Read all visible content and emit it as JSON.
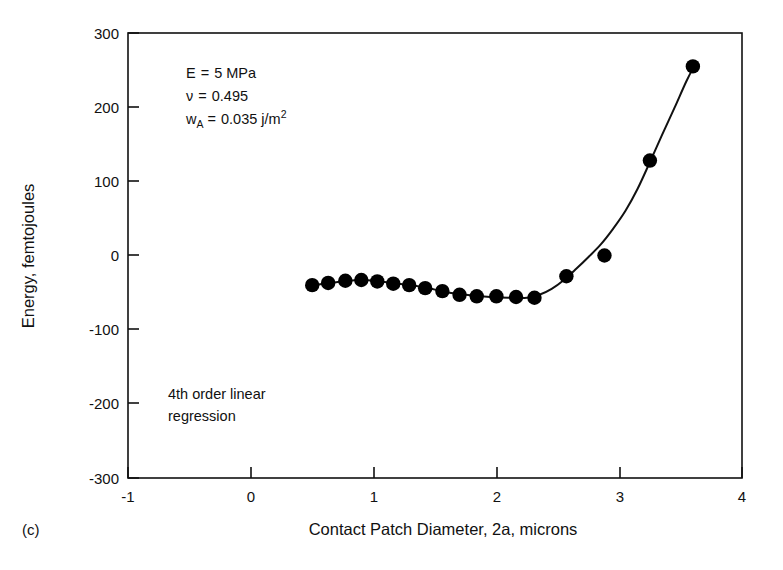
{
  "panel": {
    "label": "(c)"
  },
  "chart_data": {
    "type": "scatter",
    "title": "",
    "xlabel": "Contact Patch Diameter, 2a, microns",
    "ylabel": "Energy, femtojoules",
    "xlim": [
      -1,
      4
    ],
    "ylim": [
      -300,
      300
    ],
    "xticks": [
      -1,
      0,
      1,
      2,
      3,
      4
    ],
    "xtick_labels": [
      "-1",
      "0",
      "1",
      "2",
      "3",
      "4"
    ],
    "yticks": [
      -300,
      -200,
      -100,
      0,
      100,
      200,
      300
    ],
    "ytick_labels": [
      "-300",
      "-200",
      "-100",
      "0",
      "100",
      "200",
      "300"
    ],
    "grid": false,
    "legend": false,
    "marker": "filled-circle",
    "marker_color": "#000000",
    "line_color": "#000000",
    "series": [
      {
        "name": "Energy vs contact patch diameter",
        "x": [
          0.5,
          0.63,
          0.77,
          0.9,
          1.03,
          1.16,
          1.29,
          1.42,
          1.56,
          1.7,
          1.84,
          2.0,
          2.16,
          2.31,
          2.57,
          2.88,
          3.25,
          3.6
        ],
        "y": [
          -40,
          -37,
          -34,
          -33,
          -35,
          -38,
          -40,
          -44,
          -48,
          -53,
          -55,
          -55,
          -56,
          -57,
          -28,
          0,
          128,
          255
        ]
      }
    ],
    "fit_curve": {
      "label": "4th order linear regression",
      "x": [
        0.45,
        0.6,
        0.75,
        0.9,
        1.05,
        1.2,
        1.35,
        1.5,
        1.65,
        1.8,
        1.95,
        2.1,
        2.25,
        2.35,
        2.45,
        2.55,
        2.65,
        2.75,
        2.85,
        2.95,
        3.05,
        3.15,
        3.25,
        3.35,
        3.45,
        3.55,
        3.62
      ],
      "y": [
        -41,
        -38,
        -35,
        -33,
        -35,
        -38,
        -41,
        -46,
        -51,
        -54,
        -56,
        -57,
        -57,
        -53,
        -45,
        -33,
        -18,
        -2,
        15,
        36,
        60,
        90,
        126,
        163,
        199,
        236,
        258
      ]
    },
    "annotations": [
      {
        "name": "parameters",
        "lines": [
          {
            "label": "E",
            "eq": "=",
            "value": "5 MPa"
          },
          {
            "label": "ν",
            "eq": "=",
            "value": "0.495"
          },
          {
            "label": "w",
            "sub": "A",
            "eq": "=",
            "value": "0.035 j/m",
            "sup": "2"
          }
        ]
      },
      {
        "name": "regression-note",
        "lines": [
          "4th order linear",
          "regression"
        ]
      }
    ]
  }
}
